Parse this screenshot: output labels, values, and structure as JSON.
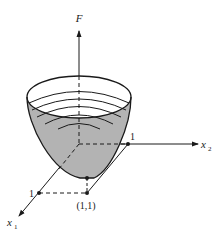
{
  "figure": {
    "type": "3d-surface-plot",
    "colors": {
      "surface_fill": "#b3b3b3",
      "line": "#1a1a1a",
      "background": "#ffffff"
    },
    "axes": {
      "vertical": {
        "label": "F"
      },
      "right": {
        "label_main": "x",
        "label_sub": "2",
        "tick_label": "1"
      },
      "front": {
        "label_main": "x",
        "label_sub": "1",
        "tick_label": "1"
      }
    },
    "minimum_point": {
      "label": "(1,1)"
    },
    "contour_rings": 5
  }
}
